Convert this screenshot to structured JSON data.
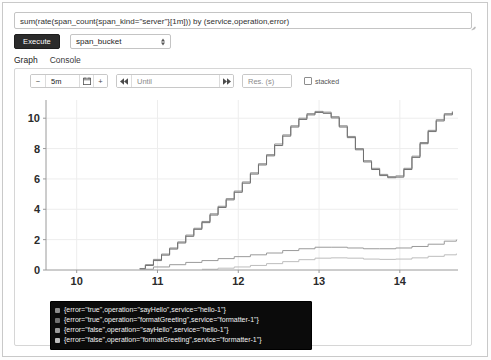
{
  "query": {
    "text": "sum(rate(span_count{span_kind=\"server\"}[1m])) by (service,operation,error)",
    "placeholder": "Expression (press Shift+Enter for newlines)"
  },
  "controls": {
    "execute_label": "Execute",
    "bucket_selected": "span_bucket",
    "bucket_options": [
      "span_bucket"
    ]
  },
  "tabs": [
    {
      "label": "Graph",
      "active": true
    },
    {
      "label": "Console",
      "active": false
    }
  ],
  "graph_toolbar": {
    "decrease_label": "−",
    "range_value": "5m",
    "calendar_icon": "calendar-icon",
    "increase_label": "+",
    "prev_label": "◀◀",
    "until_placeholder": "Until",
    "until_value": "",
    "next_label": "▶▶",
    "resolution_placeholder": "Res. (s)",
    "resolution_value": "",
    "stacked_label": "stacked",
    "stacked_checked": false
  },
  "chart_data": {
    "type": "line",
    "title": "",
    "xlabel": "",
    "ylabel": "",
    "xlim": [
      9.62,
      14.72
    ],
    "ylim": [
      0,
      11.2
    ],
    "xticks": [
      10,
      11,
      12,
      13,
      14
    ],
    "yticks": [
      0,
      2,
      4,
      6,
      8,
      10
    ],
    "grid": true,
    "legend_position": "bottom-left",
    "colors": [
      "#8c8c8c",
      "#707070",
      "#9a9a9a",
      "#bdbdbd"
    ],
    "series": [
      {
        "name": "{error=\"true\",operation=\"sayHello\",service=\"hello-1\"}",
        "color": "#8c8c8c",
        "x": [
          10.78,
          10.85,
          10.95,
          11.05,
          11.15,
          11.25,
          11.35,
          11.45,
          11.55,
          11.65,
          11.75,
          11.85,
          11.95,
          12.05,
          12.15,
          12.25,
          12.35,
          12.45,
          12.55,
          12.65,
          12.75,
          12.85,
          12.95,
          13.05,
          13.15,
          13.25,
          13.35,
          13.45,
          13.55,
          13.65,
          13.75,
          13.85,
          13.95,
          14.05,
          14.15,
          14.25,
          14.35,
          14.45,
          14.55,
          14.65
        ],
        "y": [
          0.1,
          0.35,
          0.7,
          1.05,
          1.45,
          1.85,
          2.3,
          2.75,
          3.2,
          3.7,
          4.2,
          4.7,
          5.2,
          5.8,
          6.4,
          7.0,
          7.6,
          8.3,
          8.9,
          9.5,
          10.0,
          10.3,
          10.45,
          10.4,
          10.1,
          9.5,
          8.8,
          8.0,
          7.2,
          6.7,
          6.3,
          6.15,
          6.2,
          6.7,
          7.5,
          8.4,
          9.2,
          9.9,
          10.3,
          10.45
        ]
      },
      {
        "name": "{error=\"true\",operation=\"formatGreeting\",service=\"formatter-1\"}",
        "color": "#707070",
        "x": [
          10.78,
          10.85,
          10.95,
          11.05,
          11.15,
          11.25,
          11.35,
          11.45,
          11.55,
          11.65,
          11.75,
          11.85,
          11.95,
          12.05,
          12.15,
          12.25,
          12.35,
          12.45,
          12.55,
          12.65,
          12.75,
          12.85,
          12.95,
          13.05,
          13.15,
          13.25,
          13.35,
          13.45,
          13.55,
          13.65,
          13.75,
          13.85,
          13.95,
          14.05,
          14.15,
          14.25,
          14.35,
          14.45,
          14.55,
          14.65
        ],
        "y": [
          0.08,
          0.3,
          0.62,
          0.98,
          1.38,
          1.78,
          2.22,
          2.68,
          3.12,
          3.62,
          4.12,
          4.62,
          5.12,
          5.72,
          6.32,
          6.92,
          7.52,
          8.2,
          8.82,
          9.42,
          9.92,
          10.22,
          10.38,
          10.32,
          10.02,
          9.42,
          8.72,
          7.92,
          7.12,
          6.62,
          6.22,
          6.08,
          6.12,
          6.62,
          7.42,
          8.32,
          9.12,
          9.82,
          10.22,
          10.38
        ]
      },
      {
        "name": "{error=\"false\",operation=\"sayHello\",service=\"hello-1\"}",
        "color": "#9a9a9a",
        "x": [
          10.78,
          10.95,
          11.15,
          11.35,
          11.55,
          11.75,
          11.95,
          12.15,
          12.35,
          12.55,
          12.75,
          12.95,
          13.15,
          13.35,
          13.55,
          13.75,
          13.95,
          14.15,
          14.35,
          14.55,
          14.7
        ],
        "y": [
          0.05,
          0.2,
          0.35,
          0.5,
          0.62,
          0.75,
          0.88,
          1.0,
          1.12,
          1.28,
          1.4,
          1.5,
          1.5,
          1.45,
          1.4,
          1.4,
          1.45,
          1.55,
          1.7,
          1.9,
          2.0
        ]
      },
      {
        "name": "{error=\"false\",operation=\"formatGreeting\",service=\"formatter-1\"}",
        "color": "#bdbdbd",
        "x": [
          11.55,
          11.75,
          11.95,
          12.15,
          12.35,
          12.55,
          12.75,
          12.95,
          13.15,
          13.35,
          13.55,
          13.75,
          13.95,
          14.15,
          14.35,
          14.55,
          14.7
        ],
        "y": [
          0.05,
          0.12,
          0.2,
          0.3,
          0.42,
          0.55,
          0.68,
          0.78,
          0.8,
          0.78,
          0.72,
          0.7,
          0.72,
          0.8,
          0.9,
          1.0,
          1.08
        ]
      }
    ]
  },
  "legend": [
    {
      "label": "{error=\"true\",operation=\"sayHello\",service=\"hello-1\"}",
      "color": "#8c8c8c"
    },
    {
      "label": "{error=\"true\",operation=\"formatGreeting\",service=\"formatter-1\"}",
      "color": "#707070"
    },
    {
      "label": "{error=\"false\",operation=\"sayHello\",service=\"hello-1\"}",
      "color": "#9a9a9a"
    },
    {
      "label": "{error=\"false\",operation=\"formatGreeting\",service=\"formatter-1\"}",
      "color": "#bdbdbd"
    }
  ]
}
